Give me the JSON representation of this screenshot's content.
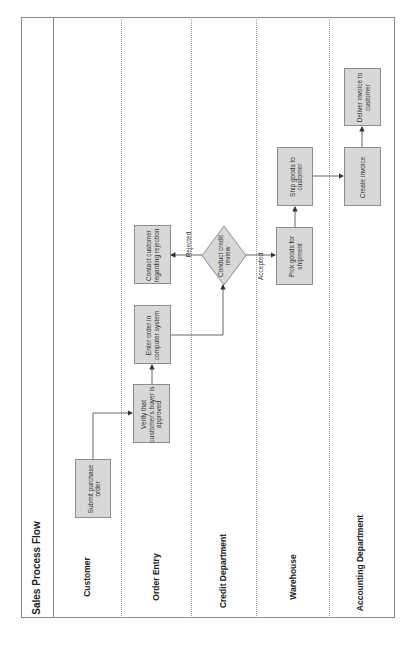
{
  "diagram": {
    "title": "Sales Process Flow",
    "orientation": "rotated-90-ccw",
    "lanes": [
      {
        "id": "customer",
        "label": "Customer"
      },
      {
        "id": "order-entry",
        "label": "Order Entry"
      },
      {
        "id": "credit",
        "label": "Credit Department"
      },
      {
        "id": "warehouse",
        "label": "Warehouse"
      },
      {
        "id": "accounting",
        "label": "Accounting Department"
      }
    ],
    "nodes": {
      "submit": {
        "label": "Submit purchase order",
        "lane": "customer",
        "shape": "process"
      },
      "verify": {
        "label": "Verify that customer's buyer is approved",
        "lane": "order-entry",
        "shape": "process"
      },
      "enter": {
        "label": "Enter order in computer system",
        "lane": "order-entry",
        "shape": "process"
      },
      "contact": {
        "label": "Contact customer regarding rejection",
        "lane": "order-entry",
        "shape": "process"
      },
      "review": {
        "label": "Conduct credit review",
        "lane": "credit",
        "shape": "decision"
      },
      "pick": {
        "label": "Pick goods for shipment",
        "lane": "warehouse",
        "shape": "process"
      },
      "ship": {
        "label": "Ship goods to customer",
        "lane": "warehouse",
        "shape": "process"
      },
      "invoice": {
        "label": "Create invoice",
        "lane": "accounting",
        "shape": "process"
      },
      "deliver": {
        "label": "Deliver invoice to customer",
        "lane": "accounting",
        "shape": "process"
      }
    },
    "edges": [
      {
        "from": "submit",
        "to": "verify",
        "label": ""
      },
      {
        "from": "verify",
        "to": "enter",
        "label": ""
      },
      {
        "from": "enter",
        "to": "review",
        "label": ""
      },
      {
        "from": "review",
        "to": "contact",
        "label": "Rejected"
      },
      {
        "from": "review",
        "to": "pick",
        "label": "Accepted"
      },
      {
        "from": "pick",
        "to": "ship",
        "label": ""
      },
      {
        "from": "ship",
        "to": "invoice",
        "label": ""
      },
      {
        "from": "invoice",
        "to": "deliver",
        "label": ""
      }
    ],
    "colors": {
      "box_fill": "#d8d8d8",
      "box_border": "#8c8c8c",
      "line": "#555555",
      "frame": "#8a8a8a"
    }
  }
}
